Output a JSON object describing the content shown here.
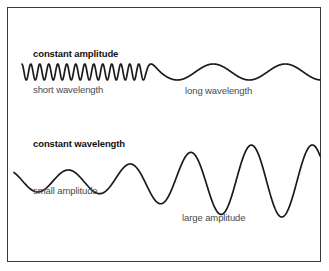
{
  "figure": {
    "background_color": "#ffffff",
    "border_color": "#3a3a3a",
    "stroke_color": "#1a1a1a"
  },
  "labels": {
    "constant_amplitude": "constant amplitude",
    "short_wavelength": "short wavelength",
    "long_wavelength": "long wavelength",
    "constant_wavelength": "constant wavelength",
    "small_amplitude": "small amplitude",
    "large_amplitude": "large amplitude"
  },
  "chart_data": {
    "type": "line",
    "xlabel": "",
    "ylabel": "",
    "grid": false,
    "legend": "none",
    "axes_visible": false,
    "series": [
      {
        "name": "constant amplitude wave",
        "description": "Sinusoid of constant amplitude whose wavelength increases from short on the left to long on the right",
        "baseline_y": 72,
        "x_start": 22,
        "x_end": 320,
        "amplitude": 8,
        "amplitude_constant": true,
        "wavelength_short": 9,
        "wavelength_long": 72,
        "cycles_short_region": 13,
        "cycles_long_region": 2,
        "annotations": [
          {
            "text": "constant amplitude",
            "x": 33,
            "y": 49,
            "bold": true
          },
          {
            "text": "short wavelength",
            "x": 33,
            "y": 85,
            "bold": false
          },
          {
            "text": "long wavelength",
            "x": 185,
            "y": 86,
            "bold": false
          }
        ]
      },
      {
        "name": "constant wavelength wave",
        "description": "Sinusoid of constant wavelength whose amplitude increases from small on the left to large on the right",
        "baseline_y": 181,
        "x_start": 14,
        "x_end": 320,
        "wavelength": 61,
        "wavelength_constant": true,
        "amplitude_small": 11,
        "amplitude_large": 36,
        "cycles": 5,
        "annotations": [
          {
            "text": "constant wavelength",
            "x": 33,
            "y": 139,
            "bold": true
          },
          {
            "text": "small amplitude",
            "x": 33,
            "y": 186,
            "bold": false
          },
          {
            "text": "large amplitude",
            "x": 182,
            "y": 213,
            "bold": false
          }
        ]
      }
    ]
  }
}
